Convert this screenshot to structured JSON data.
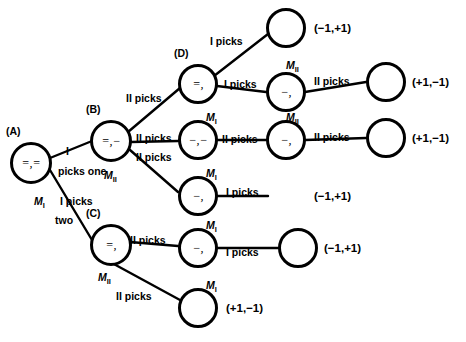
{
  "diagram": {
    "nodes": [
      {
        "id": "A",
        "tag": "(A)",
        "label": "=,=",
        "x": 10,
        "y": 142,
        "d": 42
      },
      {
        "id": "B",
        "tag": "(B)",
        "label": "=,−",
        "x": 90,
        "y": 120,
        "d": 42
      },
      {
        "id": "C",
        "tag": "(C)",
        "label": "=,",
        "x": 90,
        "y": 224,
        "d": 42
      },
      {
        "id": "D",
        "tag": "(D)",
        "label": "=,",
        "x": 178,
        "y": 64,
        "d": 40
      },
      {
        "id": "E1",
        "tag": "",
        "label": "",
        "x": 266,
        "y": 8,
        "d": 40
      },
      {
        "id": "E2",
        "tag": "",
        "label": "−,",
        "x": 266,
        "y": 72,
        "d": 40
      },
      {
        "id": "E3",
        "tag": "",
        "label": "−,−",
        "x": 178,
        "y": 120,
        "d": 40
      },
      {
        "id": "E4",
        "tag": "",
        "label": "−,",
        "x": 266,
        "y": 120,
        "d": 40
      },
      {
        "id": "E5",
        "tag": "",
        "label": "−,",
        "x": 178,
        "y": 176,
        "d": 40
      },
      {
        "id": "E6",
        "tag": "",
        "label": "−,",
        "x": 178,
        "y": 228,
        "d": 40
      },
      {
        "id": "F1",
        "tag": "",
        "label": "",
        "x": 366,
        "y": 62,
        "d": 40
      },
      {
        "id": "F2",
        "tag": "",
        "label": "",
        "x": 366,
        "y": 118,
        "d": 40
      },
      {
        "id": "F3",
        "tag": "",
        "label": "",
        "x": 278,
        "y": 228,
        "d": 40
      },
      {
        "id": "F4",
        "tag": "",
        "label": "",
        "x": 178,
        "y": 288,
        "d": 40
      }
    ],
    "edge_labels": [
      {
        "id": "l-a-b",
        "text": "I",
        "x": 66,
        "y": 146
      },
      {
        "id": "l-a-one",
        "text": "picks one",
        "x": 58,
        "y": 166
      },
      {
        "id": "l-a-c1",
        "text": "I picks",
        "x": 60,
        "y": 196
      },
      {
        "id": "l-a-c2",
        "text": "two",
        "x": 55,
        "y": 215
      },
      {
        "id": "l-b-d",
        "text": "II picks",
        "x": 126,
        "y": 93
      },
      {
        "id": "l-b-e3",
        "text": "II picks",
        "x": 136,
        "y": 133
      },
      {
        "id": "l-b-e5",
        "text": "II picks",
        "x": 136,
        "y": 152
      },
      {
        "id": "l-d-e1",
        "text": "I picks",
        "x": 210,
        "y": 36
      },
      {
        "id": "l-d-e2",
        "text": "I picks",
        "x": 224,
        "y": 79
      },
      {
        "id": "l-e3-e4",
        "text": "II picks",
        "x": 222,
        "y": 134
      },
      {
        "id": "l-e2-f1",
        "text": "II picks",
        "x": 314,
        "y": 76
      },
      {
        "id": "l-e4-f2",
        "text": "II picks",
        "x": 314,
        "y": 132
      },
      {
        "id": "l-e5-f",
        "text": "I picks",
        "x": 226,
        "y": 187
      },
      {
        "id": "l-c-e6",
        "text": "II picks",
        "x": 130,
        "y": 235
      },
      {
        "id": "l-e6-f3",
        "text": "I picks",
        "x": 226,
        "y": 247
      },
      {
        "id": "l-c-f4",
        "text": "II picks",
        "x": 116,
        "y": 291
      }
    ],
    "player_marks": [
      {
        "id": "m-a",
        "player": "M",
        "sub": "I",
        "x": 34,
        "y": 196
      },
      {
        "id": "m-b",
        "player": "M",
        "sub": "II",
        "x": 104,
        "y": 170
      },
      {
        "id": "m-d",
        "player": "M",
        "sub": "II",
        "x": 286,
        "y": 60
      },
      {
        "id": "m-e3a",
        "player": "M",
        "sub": "I",
        "x": 206,
        "y": 112
      },
      {
        "id": "m-e4",
        "player": "M",
        "sub": "II",
        "x": 286,
        "y": 112
      },
      {
        "id": "m-e5",
        "player": "M",
        "sub": "I",
        "x": 206,
        "y": 168
      },
      {
        "id": "m-c",
        "player": "M",
        "sub": "II",
        "x": 98,
        "y": 272
      },
      {
        "id": "m-e6",
        "player": "M",
        "sub": "I",
        "x": 206,
        "y": 220
      },
      {
        "id": "m-f4",
        "player": "M",
        "sub": "I",
        "x": 206,
        "y": 280
      }
    ],
    "payoffs": [
      {
        "id": "p1",
        "text": "(−1,+1)",
        "x": 314,
        "y": 22
      },
      {
        "id": "p2",
        "text": "(+1,−1)",
        "x": 412,
        "y": 76
      },
      {
        "id": "p3",
        "text": "(+1,−1)",
        "x": 412,
        "y": 132
      },
      {
        "id": "p4",
        "text": "(−1,+1)",
        "x": 314,
        "y": 190
      },
      {
        "id": "p5",
        "text": "(−1,+1)",
        "x": 324,
        "y": 242
      },
      {
        "id": "p6",
        "text": "(+1,−1)",
        "x": 226,
        "y": 302
      }
    ],
    "edges": [
      {
        "id": "e-a-b",
        "x1": 50,
        "y1": 158,
        "x2": 92,
        "y2": 141
      },
      {
        "id": "e-a-c",
        "x1": 50,
        "y1": 170,
        "x2": 92,
        "y2": 240
      },
      {
        "id": "e-b-d",
        "x1": 128,
        "y1": 132,
        "x2": 180,
        "y2": 88
      },
      {
        "id": "e-b-e3",
        "x1": 131,
        "y1": 142,
        "x2": 178,
        "y2": 141
      },
      {
        "id": "e-b-e5",
        "x1": 130,
        "y1": 150,
        "x2": 178,
        "y2": 192
      },
      {
        "id": "e-d-e1",
        "x1": 214,
        "y1": 76,
        "x2": 268,
        "y2": 34
      },
      {
        "id": "e-d-e2",
        "x1": 217,
        "y1": 86,
        "x2": 266,
        "y2": 92
      },
      {
        "id": "e-e2-f1",
        "x1": 305,
        "y1": 92,
        "x2": 366,
        "y2": 82
      },
      {
        "id": "e-e3-e4",
        "x1": 217,
        "y1": 140,
        "x2": 266,
        "y2": 140
      },
      {
        "id": "e-e4-f2",
        "x1": 305,
        "y1": 140,
        "x2": 366,
        "y2": 138
      },
      {
        "id": "e-e5-f",
        "x1": 217,
        "y1": 196,
        "x2": 268,
        "y2": 196
      },
      {
        "id": "e-c-e6",
        "x1": 130,
        "y1": 242,
        "x2": 178,
        "y2": 246
      },
      {
        "id": "e-e6-f3",
        "x1": 217,
        "y1": 248,
        "x2": 278,
        "y2": 248
      },
      {
        "id": "e-c-f4",
        "x1": 112,
        "y1": 263,
        "x2": 180,
        "y2": 300
      }
    ],
    "dummy_nodes_payoff_right": []
  }
}
